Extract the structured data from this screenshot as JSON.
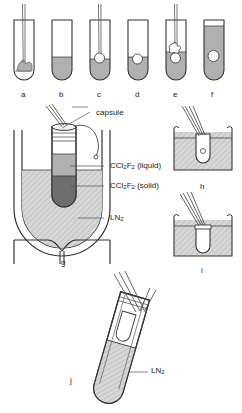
{
  "figure": {
    "background_color": "#ffffff",
    "line_color": "#333333",
    "fill_liquid": "#b0b0b0",
    "fill_solid": "#6e6e6e",
    "fill_hatch": "#cccccc",
    "fill_white": "#ffffff"
  },
  "panels": [
    {
      "id": "a",
      "label": "a",
      "caption": "tube with rod and droplet at base"
    },
    {
      "id": "b",
      "label": "b",
      "caption": "tube with liquid at base"
    },
    {
      "id": "c",
      "label": "c",
      "caption": "tube with rod and bubble in liquid"
    },
    {
      "id": "d",
      "label": "d",
      "caption": "tube with bubble in liquid"
    },
    {
      "id": "e",
      "label": "e",
      "caption": "tube with rod, blob and bubble"
    },
    {
      "id": "f",
      "label": "f",
      "caption": "tube filled with liquid and bubble"
    },
    {
      "id": "g",
      "label": "g",
      "caption": "capsule in Dewar flask of liquid nitrogen"
    },
    {
      "id": "h",
      "label": "h",
      "caption": "tweezers holding capsule above bath"
    },
    {
      "id": "i",
      "label": "i",
      "caption": "tweezers lowering capsule into bath"
    },
    {
      "id": "j",
      "label": "j",
      "caption": "tilted tube with capsule in liquid nitrogen"
    }
  ],
  "annotations": {
    "capsule": "capsule",
    "liquid": "CCl",
    "liquid_sub1": "2",
    "liquid_mid": "F",
    "liquid_sub2": "2",
    "liquid_state": " (liquid)",
    "solid": "CCl",
    "solid_sub1": "2",
    "solid_mid": "F",
    "solid_sub2": "2",
    "solid_state": " (solid)",
    "ln2": "LN",
    "ln2_sub": "2",
    "ln2_j": "LN",
    "ln2_j_sub": "2"
  }
}
